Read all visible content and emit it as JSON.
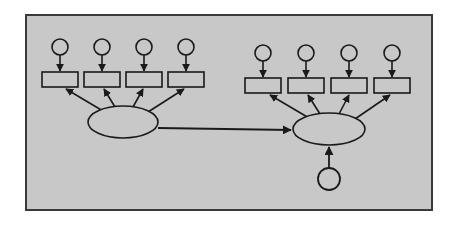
{
  "figure": {
    "kind": "directed-graph-diagram",
    "canvas": {
      "width": 460,
      "height": 229
    },
    "colors": {
      "page_background": "#ffffff",
      "panel_fill": "#c8c8c8",
      "panel_border": "#3a3a3a",
      "stroke": "#1a1a1a",
      "node_fill": "#c8c8c8"
    },
    "panel": {
      "x": 25,
      "y": 14,
      "width": 408,
      "height": 197,
      "border_width": 2
    }
  },
  "diagram_data": {
    "type": "diagram",
    "node_counts": {
      "ellipses": 2,
      "rectangles": 8,
      "top_circles": 8,
      "bottom_circles": 1,
      "total_nodes": 19
    },
    "edge_counts": {
      "circle_to_rectangle": 8,
      "ellipse_to_rectangle": 8,
      "ellipse_to_ellipse": 1,
      "circle_to_ellipse": 1,
      "total_edges": 18
    },
    "groups": [
      {
        "id": "left-cluster",
        "hub": {
          "id": "left-hub",
          "shape": "ellipse",
          "cx": 123,
          "cy": 122,
          "rx": 35,
          "ry": 16
        },
        "rectangles": [
          {
            "id": "left-rect-1",
            "x": 42,
            "y": 72,
            "width": 36,
            "height": 15
          },
          {
            "id": "left-rect-2",
            "x": 84,
            "y": 72,
            "width": 36,
            "height": 15
          },
          {
            "id": "left-rect-3",
            "x": 126,
            "y": 72,
            "width": 36,
            "height": 15
          },
          {
            "id": "left-rect-4",
            "x": 168,
            "y": 72,
            "width": 36,
            "height": 15
          }
        ],
        "circles": [
          {
            "id": "left-circle-1",
            "cx": 60,
            "cy": 47,
            "r": 8
          },
          {
            "id": "left-circle-2",
            "cx": 102,
            "cy": 47,
            "r": 8
          },
          {
            "id": "left-circle-3",
            "cx": 144,
            "cy": 47,
            "r": 8
          },
          {
            "id": "left-circle-4",
            "cx": 186,
            "cy": 47,
            "r": 8
          }
        ]
      },
      {
        "id": "right-cluster",
        "hub": {
          "id": "right-hub",
          "shape": "ellipse",
          "cx": 329,
          "cy": 129,
          "rx": 36,
          "ry": 16
        },
        "rectangles": [
          {
            "id": "right-rect-1",
            "x": 245,
            "y": 78,
            "width": 36,
            "height": 15
          },
          {
            "id": "right-rect-2",
            "x": 288,
            "y": 78,
            "width": 36,
            "height": 15
          },
          {
            "id": "right-rect-3",
            "x": 331,
            "y": 78,
            "width": 36,
            "height": 15
          },
          {
            "id": "right-rect-4",
            "x": 374,
            "y": 78,
            "width": 36,
            "height": 15
          }
        ],
        "circles": [
          {
            "id": "right-circle-1",
            "cx": 263,
            "cy": 53,
            "r": 8
          },
          {
            "id": "right-circle-2",
            "cx": 306,
            "cy": 53,
            "r": 8
          },
          {
            "id": "right-circle-3",
            "cx": 349,
            "cy": 53,
            "r": 8
          },
          {
            "id": "right-circle-4",
            "cx": 392,
            "cy": 53,
            "r": 8
          }
        ],
        "source": {
          "id": "right-source-circle",
          "cx": 329,
          "cy": 179,
          "r": 11
        }
      }
    ],
    "connector": {
      "id": "hub-to-hub-arrow",
      "from": "left-hub",
      "to": "right-hub",
      "x1": 158,
      "y1": 128,
      "x2": 291,
      "y2": 130,
      "direction": "left-to-right"
    }
  }
}
